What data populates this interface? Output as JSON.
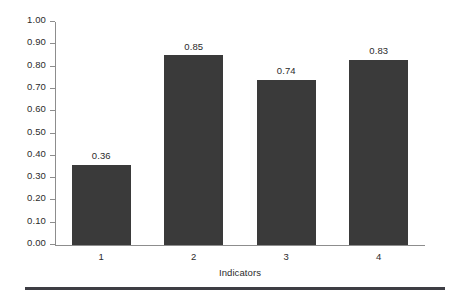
{
  "chart_data": {
    "type": "bar",
    "title": "",
    "subtitle": "",
    "xlabel": "Indicators",
    "ylabel": "",
    "categories": [
      "1",
      "2",
      "3",
      "4"
    ],
    "values": [
      0.36,
      0.85,
      0.74,
      0.83
    ],
    "data_labels": [
      "0.36",
      "0.85",
      "0.74",
      "0.83"
    ],
    "ylim": [
      0.0,
      1.0
    ],
    "ytick_values": [
      0.0,
      0.1,
      0.2,
      0.3,
      0.4,
      0.5,
      0.6,
      0.7,
      0.8,
      0.9,
      1.0
    ],
    "ytick_labels": [
      "0.00",
      "0.10",
      "0.20",
      "0.30",
      "0.40",
      "0.50",
      "0.60",
      "0.70",
      "0.80",
      "0.90",
      "1.00"
    ],
    "grid": false,
    "legend": false,
    "legend_position": "none",
    "series": [
      {
        "name": "",
        "values": [
          0.36,
          0.85,
          0.74,
          0.83
        ]
      }
    ]
  },
  "style": {
    "bar_color": "#3a3a3a",
    "axis_color": "#8d8d8d",
    "text_color": "#2b2b2b",
    "background_color": "#ffffff",
    "rule_color": "#3e3e44"
  }
}
